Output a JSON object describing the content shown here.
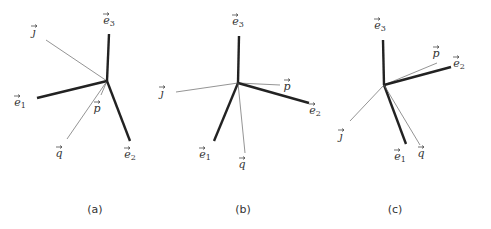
{
  "figure": {
    "panels": [
      {
        "caption": "(a)",
        "center": [
          107,
          81
        ],
        "vectors": [
          {
            "name": "e3",
            "letter": "e",
            "sub": "3",
            "end": [
              109,
              34
            ],
            "weight": "thick",
            "label_pos": [
              109,
              24
            ]
          },
          {
            "name": "j",
            "letter": "ȷ",
            "sub": "",
            "end": [
              46,
              40
            ],
            "weight": "thin",
            "label_pos": [
              34,
              36
            ]
          },
          {
            "name": "e1",
            "letter": "e",
            "sub": "1",
            "end": [
              37,
              98
            ],
            "weight": "thick",
            "label_pos": [
              20,
              106
            ]
          },
          {
            "name": "p",
            "letter": "p",
            "sub": "",
            "end": [
              101,
              95
            ],
            "weight": "thin",
            "label_pos": [
              97,
              112
            ]
          },
          {
            "name": "q",
            "letter": "q",
            "sub": "",
            "end": [
              67,
              139
            ],
            "weight": "thin",
            "label_pos": [
              59,
              157
            ]
          },
          {
            "name": "e2",
            "letter": "e",
            "sub": "2",
            "end": [
              130,
              141
            ],
            "weight": "thick",
            "label_pos": [
              130,
              158
            ]
          }
        ]
      },
      {
        "caption": "(b)",
        "center": [
          238,
          83
        ],
        "vectors": [
          {
            "name": "e3",
            "letter": "e",
            "sub": "3",
            "end": [
              239,
              36
            ],
            "weight": "thick",
            "label_pos": [
              238,
              25
            ]
          },
          {
            "name": "j",
            "letter": "ȷ",
            "sub": "",
            "end": [
              176,
              92
            ],
            "weight": "thin",
            "label_pos": [
              162,
              97
            ]
          },
          {
            "name": "p",
            "letter": "p",
            "sub": "",
            "end": [
              280,
              85
            ],
            "weight": "thin",
            "label_pos": [
              287,
              90
            ]
          },
          {
            "name": "e2",
            "letter": "e",
            "sub": "2",
            "end": [
              309,
              103
            ],
            "weight": "thick",
            "label_pos": [
              315,
              114
            ]
          },
          {
            "name": "e1",
            "letter": "e",
            "sub": "1",
            "end": [
              214,
              141
            ],
            "weight": "thick",
            "label_pos": [
              205,
              158
            ]
          },
          {
            "name": "q",
            "letter": "q",
            "sub": "",
            "end": [
              245,
              153
            ],
            "weight": "thin",
            "label_pos": [
              242,
              168
            ]
          }
        ]
      },
      {
        "caption": "(c)",
        "center": [
          384,
          85
        ],
        "vectors": [
          {
            "name": "e3",
            "letter": "e",
            "sub": "3",
            "end": [
              383,
              40
            ],
            "weight": "thick",
            "label_pos": [
              380,
              29
            ]
          },
          {
            "name": "p",
            "letter": "p",
            "sub": "",
            "end": [
              437,
              63
            ],
            "weight": "thin",
            "label_pos": [
              436,
              57
            ]
          },
          {
            "name": "e2",
            "letter": "e",
            "sub": "2",
            "end": [
              451,
              67
            ],
            "weight": "thick",
            "label_pos": [
              459,
              67
            ]
          },
          {
            "name": "j",
            "letter": "ȷ",
            "sub": "",
            "end": [
              350,
              121
            ],
            "weight": "thin",
            "label_pos": [
              341,
              140
            ]
          },
          {
            "name": "e1",
            "letter": "e",
            "sub": "1",
            "end": [
              406,
              144
            ],
            "weight": "thick",
            "label_pos": [
              400,
              160
            ]
          },
          {
            "name": "q",
            "letter": "q",
            "sub": "",
            "end": [
              420,
              145
            ],
            "weight": "thin",
            "label_pos": [
              421,
              157
            ]
          }
        ]
      }
    ],
    "caption_positions": [
      [
        95,
        213
      ],
      [
        243,
        213
      ],
      [
        395,
        213
      ]
    ]
  }
}
